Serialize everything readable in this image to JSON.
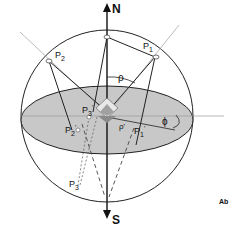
{
  "diagram": {
    "poles": {
      "north": "N",
      "south": "S"
    },
    "points": {
      "p1": "P",
      "p1_sub": "1",
      "p2": "P",
      "p2_sub": "2",
      "p3": "P",
      "p3_sub": "3",
      "p1_proj": "P",
      "p1_proj_sub": "1",
      "p1_proj_prime": "'",
      "p2_proj": "P",
      "p2_proj_sub": "2",
      "p2_proj_prime": "'",
      "p3_proj": "P",
      "p3_proj_sub": "3",
      "p3_proj_prime": "'"
    },
    "angles": {
      "rho": "ρ",
      "rho_prime": "ρ'",
      "phi": "ϕ"
    },
    "corner_label": "Ab",
    "colors": {
      "equator_fill": "#c8c8c8",
      "line": "#222222",
      "crystal_dark": "#8a8a8a",
      "crystal_light": "#e8e8e8"
    }
  }
}
